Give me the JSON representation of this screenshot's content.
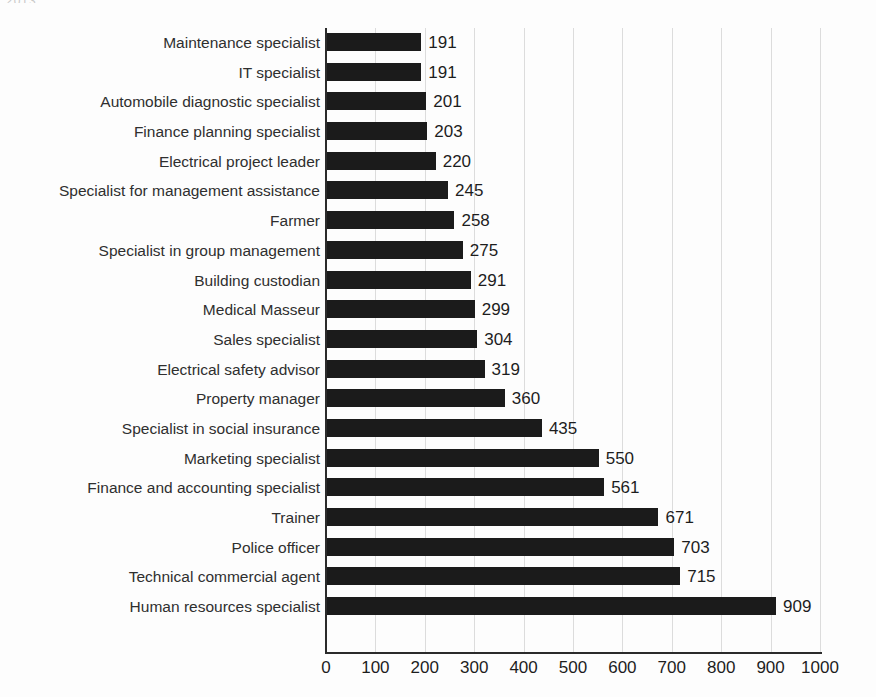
{
  "scan": {
    "top_fragment": "2013"
  },
  "chart_data": {
    "type": "bar",
    "orientation": "horizontal",
    "title": "",
    "subtitle": "",
    "xlabel": "",
    "ylabel": "",
    "xlim": [
      0,
      1000
    ],
    "xticks": [
      0,
      100,
      200,
      300,
      400,
      500,
      600,
      700,
      800,
      900,
      1000
    ],
    "grid": "vertical",
    "legend": "none",
    "bar_color": "#1b1b1b",
    "show_value_labels": true,
    "categories": [
      "Maintenance specialist",
      "IT specialist",
      "Automobile diagnostic specialist",
      "Finance planning specialist",
      "Electrical project leader",
      "Specialist for management assistance",
      "Farmer",
      "Specialist in group management",
      "Building custodian",
      "Medical Masseur",
      "Sales specialist",
      "Electrical safety advisor",
      "Property manager",
      "Specialist in social insurance",
      "Marketing specialist",
      "Finance and accounting specialist",
      "Trainer",
      "Police officer",
      "Technical commercial agent",
      "Human resources specialist"
    ],
    "values": [
      191,
      191,
      201,
      203,
      220,
      245,
      258,
      275,
      291,
      299,
      304,
      319,
      360,
      435,
      550,
      561,
      671,
      703,
      715,
      909
    ]
  }
}
